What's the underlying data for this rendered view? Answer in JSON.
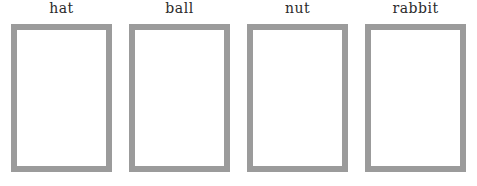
{
  "worksheet": {
    "background_color": "#ffffff",
    "box_border_color": "#9a9a9a",
    "box_fill_color": "#ffffff",
    "label_color": "#2b2b2b",
    "items": [
      {
        "label": "hat",
        "box_content": ""
      },
      {
        "label": "ball",
        "box_content": ""
      },
      {
        "label": "nut",
        "box_content": ""
      },
      {
        "label": "rabbit",
        "box_content": ""
      }
    ]
  }
}
